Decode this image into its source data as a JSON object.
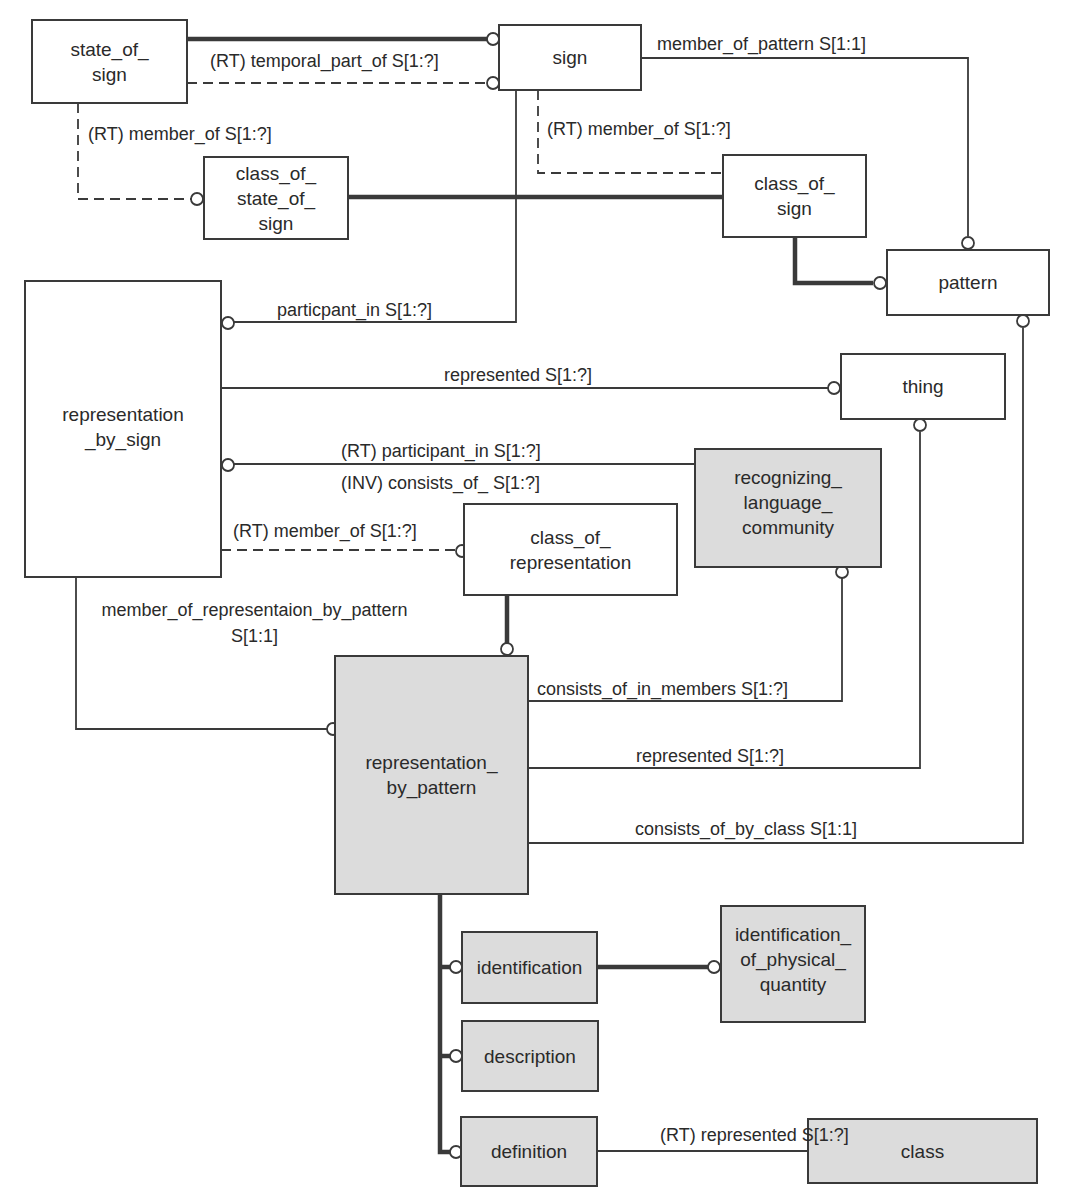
{
  "diagram": {
    "colors": {
      "line": "#3a3a3a",
      "shaded_fill": "#dcdcdc",
      "plain_fill": "#ffffff",
      "text": "#2a2a2a"
    },
    "entities": {
      "state_of_sign": {
        "text": "state_of_\nsign",
        "shaded": false
      },
      "sign": {
        "text": "sign",
        "shaded": false
      },
      "class_of_state_of_sign": {
        "text": "class_of_\nstate_of_\nsign",
        "shaded": false
      },
      "class_of_sign": {
        "text": "class_of_\nsign",
        "shaded": false
      },
      "pattern": {
        "text": "pattern",
        "shaded": false
      },
      "representation_by_sign": {
        "text": "representation\n_by_sign",
        "shaded": false
      },
      "thing": {
        "text": "thing",
        "shaded": false
      },
      "recognizing_language_community": {
        "text": "recognizing_\nlanguage_\ncommunity",
        "shaded": true
      },
      "class_of_representation": {
        "text": "class_of_\nrepresentation",
        "shaded": false
      },
      "representation_by_pattern": {
        "text": "representation_\nby_pattern",
        "shaded": true
      },
      "identification": {
        "text": "identification",
        "shaded": true
      },
      "identification_of_physical_quantity": {
        "text": "identification_\nof_physical_\nquantity",
        "shaded": true
      },
      "description": {
        "text": "description",
        "shaded": true
      },
      "definition": {
        "text": "definition",
        "shaded": true
      },
      "class": {
        "text": "class",
        "shaded": true
      }
    },
    "relationships": {
      "temporal_part_of": {
        "label": "(RT) temporal_part_of S[1:?]",
        "from": "state_of_sign",
        "to": "sign",
        "style": "dashed"
      },
      "state_of_sign_member_of": {
        "label": "(RT) member_of S[1:?]",
        "from": "state_of_sign",
        "to": "class_of_state_of_sign",
        "style": "dashed"
      },
      "member_of_pattern": {
        "label": "member_of_pattern S[1:1]",
        "from": "sign",
        "to": "pattern",
        "style": "solid"
      },
      "sign_member_of": {
        "label": "(RT) member_of S[1:?]",
        "from": "sign",
        "to": "class_of_sign",
        "style": "dashed"
      },
      "particpant_in": {
        "label": "particpant_in S[1:?]",
        "from": "sign",
        "to": "representation_by_sign",
        "style": "solid"
      },
      "represented_thing": {
        "label": "represented S[1:?]",
        "from": "representation_by_sign",
        "to": "thing",
        "style": "solid"
      },
      "rt_participant_in": {
        "label": "(RT) participant_in S[1:?]",
        "from": "recognizing_language_community",
        "to": "representation_by_sign",
        "style": "solid"
      },
      "inv_consists_of": {
        "label": "(INV) consists_of_ S[1:?]",
        "from": "recognizing_language_community",
        "to": "representation_by_sign",
        "style": "solid"
      },
      "rbs_member_of": {
        "label": "(RT) member_of S[1:?]",
        "from": "representation_by_sign",
        "to": "class_of_representation",
        "style": "dashed"
      },
      "member_of_representaion_by_pattern": {
        "label": "member_of_representaion_by_pattern\nS[1:1]",
        "from": "representation_by_sign",
        "to": "representation_by_pattern",
        "style": "solid"
      },
      "consists_of_in_members": {
        "label": "consists_of_in_members S[1:?]",
        "from": "representation_by_pattern",
        "to": "recognizing_language_community",
        "style": "solid"
      },
      "rbp_represented": {
        "label": "represented S[1:?]",
        "from": "representation_by_pattern",
        "to": "thing",
        "style": "solid"
      },
      "consists_of_by_class": {
        "label": "consists_of_by_class S[1:1]",
        "from": "representation_by_pattern",
        "to": "pattern",
        "style": "solid"
      },
      "definition_represented": {
        "label": "(RT) represented S[1:?]",
        "from": "definition",
        "to": "class",
        "style": "solid"
      }
    }
  }
}
